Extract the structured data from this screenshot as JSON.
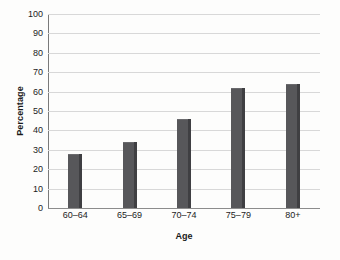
{
  "chart_data": {
    "type": "bar",
    "title": "",
    "categories": [
      "60–64",
      "65–69",
      "70–74",
      "75–79",
      "80+"
    ],
    "values": [
      28,
      34,
      46,
      62,
      64
    ],
    "xlabel": "Age",
    "ylabel": "Percentage",
    "ylim": [
      0,
      100
    ],
    "ytick_labels": [
      "0",
      "10",
      "20",
      "30",
      "40",
      "50",
      "60",
      "70",
      "80",
      "90",
      "100"
    ],
    "ytick_values": [
      0,
      10,
      20,
      30,
      40,
      50,
      60,
      70,
      80,
      90,
      100
    ],
    "grid": "horizontal",
    "legend": "none",
    "colors": {
      "bar_face": "#57575a",
      "bar_shadow": "#3f3f42",
      "gridline": "#d8d8d8",
      "axis_line": "#7a7a7a",
      "baseline": "#8c8c8c",
      "background": "#fdfdfc",
      "text": "#1c1c1c"
    }
  }
}
